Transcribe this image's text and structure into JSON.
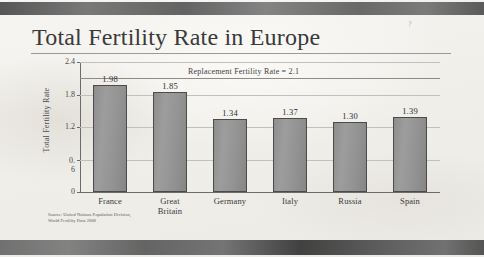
{
  "slide": {
    "title": "Total Fertility Rate in Europe",
    "corner_mark": "?",
    "source_line1": "Source: United Nations Population Division,",
    "source_line2": "World Fertility Data 2008"
  },
  "colors": {
    "bar_fill": "#939393",
    "bar_border": "#4b4b4b",
    "gridline": "#c3c0ba",
    "axis": "#6b6b6b",
    "text": "#3a3a3a",
    "band": "#5e5e5e"
  },
  "chart_data": {
    "type": "bar",
    "title": "Total Fertility Rate in Europe",
    "xlabel": "",
    "ylabel": "Total Fertility Rate",
    "categories": [
      "France",
      "Great Britain",
      "Germany",
      "Italy",
      "Russia",
      "Spain"
    ],
    "category_lines": [
      [
        "France"
      ],
      [
        "Great",
        "Britain"
      ],
      [
        "Germany"
      ],
      [
        "Italy"
      ],
      [
        "Russia"
      ],
      [
        "Spain"
      ]
    ],
    "values": [
      1.98,
      1.85,
      1.34,
      1.37,
      1.3,
      1.39
    ],
    "value_labels": [
      "1.98",
      "1.85",
      "1.34",
      "1.37",
      "1.30",
      "1.39"
    ],
    "ylim": [
      0,
      2.4
    ],
    "yticks": [
      0,
      0.6,
      1.2,
      1.8,
      2.4
    ],
    "ytick_labels": [
      "0",
      "0.6",
      "1.2",
      "1.8",
      "2.4"
    ],
    "ytick_label_lines": [
      [
        "0"
      ],
      [
        "0.",
        "6"
      ],
      [
        "1.2"
      ],
      [
        "1.8"
      ],
      [
        "2.4"
      ]
    ],
    "grid": true,
    "legend": false,
    "annotations": [
      {
        "name": "replacement-fertility-rate",
        "label": "Replacement Fertility Rate = 2.1",
        "value": 2.1,
        "orientation": "horizontal"
      }
    ],
    "source": "Source: United Nations Population Division, World Fertility Data 2008"
  }
}
